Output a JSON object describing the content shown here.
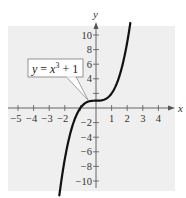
{
  "chart_data": {
    "type": "line",
    "title": "",
    "xlabel": "x",
    "ylabel": "y",
    "xlim": [
      -5.5,
      5
    ],
    "ylim": [
      -11.5,
      11.5
    ],
    "grid": false,
    "legend": null,
    "x_ticks": [
      -5,
      -4,
      -3,
      -2,
      -1,
      1,
      2,
      3,
      4
    ],
    "x_tick_labels": [
      "-5",
      "-4",
      "-3",
      "-2",
      "1",
      "2",
      "3",
      "4"
    ],
    "y_ticks": [
      -10,
      -8,
      -6,
      -4,
      -2,
      2,
      4,
      6,
      8,
      10
    ],
    "y_tick_labels": [
      "10",
      "8",
      "6",
      "4",
      "-2",
      "-4",
      "-6",
      "-8",
      "-10"
    ],
    "series": [
      {
        "name": "y = x^3 + 1",
        "function": "x^3 + 1",
        "x": [
          -2.35,
          -2.2,
          -2.0,
          -1.8,
          -1.6,
          -1.4,
          -1.2,
          -1.0,
          -0.8,
          -0.6,
          -0.4,
          -0.2,
          0.0,
          0.2,
          0.4,
          0.6,
          0.8,
          1.0,
          1.2,
          1.4,
          1.6,
          1.8,
          2.0,
          2.2
        ],
        "values": [
          -11.98,
          -9.65,
          -7.0,
          -4.83,
          -3.1,
          -1.74,
          -0.73,
          0.0,
          0.49,
          0.78,
          0.94,
          0.99,
          1.0,
          1.01,
          1.06,
          1.22,
          1.51,
          2.0,
          2.73,
          3.74,
          5.1,
          6.83,
          9.0,
          11.65
        ]
      }
    ],
    "annotations": [
      {
        "text": "y = x^3 + 1",
        "points_to": [
          -0.5,
          0.9
        ]
      }
    ]
  },
  "labels": {
    "x_axis": "x",
    "y_axis": "y",
    "equation": {
      "lhs": "y",
      "eq": " = ",
      "base": "x",
      "exp": "3",
      "rest": " + 1"
    },
    "x_ticks": [
      "−5",
      "−4",
      "−3",
      "−2",
      "1",
      "2",
      "3",
      "4"
    ],
    "y_ticks_pos": [
      "10",
      "8",
      "6",
      "4"
    ],
    "y_ticks_neg": [
      "−2",
      "−4",
      "−6",
      "−8",
      "−10"
    ]
  },
  "colors": {
    "panel": "#efefef",
    "axis": "#555555",
    "curve": "#111111",
    "callout_border": "#888888"
  }
}
